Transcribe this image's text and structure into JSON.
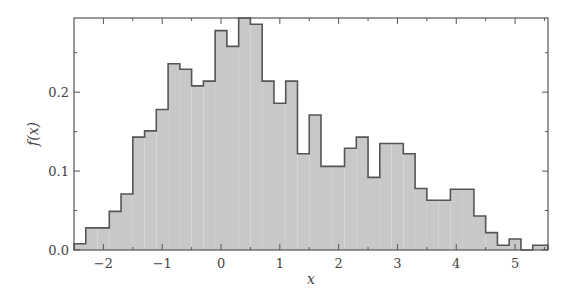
{
  "chart_data": {
    "type": "bar",
    "subtype": "histogram-step-filled",
    "title": "",
    "xlabel": "x",
    "ylabel": "f(x)",
    "xlim": [
      -2.5,
      5.56
    ],
    "ylim": [
      0.0,
      0.294
    ],
    "xticks": [
      -2,
      -1,
      0,
      1,
      2,
      3,
      4,
      5
    ],
    "xtick_labels": [
      "−2",
      "−1",
      "0",
      "1",
      "2",
      "3",
      "4",
      "5"
    ],
    "yticks": [
      0.0,
      0.1,
      0.2
    ],
    "ytick_labels": [
      "0.0",
      "0.1",
      "0.2"
    ],
    "yminor_ticks": [
      0.05,
      0.15,
      0.25
    ],
    "xminor_ticks": [
      -1.5,
      -0.5,
      0.5,
      1.5,
      2.5,
      3.5,
      4.5,
      5.5
    ],
    "grid": false,
    "legend": null,
    "fill_color": "#c8c8c8",
    "edge_color": "#555555",
    "bin_start": -2.5,
    "bin_width": 0.2,
    "bin_edges": [
      -2.5,
      -2.3,
      -2.1,
      -1.9,
      -1.7,
      -1.5,
      -1.3,
      -1.1,
      -0.9,
      -0.7,
      -0.5,
      -0.3,
      -0.1,
      0.1,
      0.3,
      0.5,
      0.7,
      0.9,
      1.1,
      1.3,
      1.5,
      1.7,
      1.9,
      2.1,
      2.3,
      2.5,
      2.7,
      2.9,
      3.1,
      3.3,
      3.5,
      3.7,
      3.9,
      4.1,
      4.3,
      4.5,
      4.7,
      4.9,
      5.1,
      5.3,
      5.5,
      5.56
    ],
    "values": [
      0.008,
      0.028,
      0.028,
      0.049,
      0.071,
      0.143,
      0.151,
      0.178,
      0.236,
      0.229,
      0.208,
      0.214,
      0.278,
      0.258,
      0.294,
      0.286,
      0.214,
      0.186,
      0.214,
      0.122,
      0.171,
      0.106,
      0.106,
      0.129,
      0.143,
      0.092,
      0.135,
      0.135,
      0.122,
      0.078,
      0.063,
      0.063,
      0.077,
      0.077,
      0.043,
      0.022,
      0.006,
      0.014,
      0.0,
      0.006,
      0.006
    ]
  }
}
